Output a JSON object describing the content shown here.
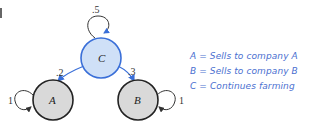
{
  "diagram": {
    "type": "state-transition",
    "nodes": [
      {
        "id": "C",
        "label": "C",
        "fill": "#cfe0f7",
        "stroke": "#3a6fd8"
      },
      {
        "id": "A",
        "label": "A",
        "fill": "#d9d9d9",
        "stroke": "#222222"
      },
      {
        "id": "B",
        "label": "B",
        "fill": "#d9d9d9",
        "stroke": "#222222"
      }
    ],
    "edges": [
      {
        "from": "C",
        "to": "C",
        "label": ".5"
      },
      {
        "from": "C",
        "to": "A",
        "label": ".2"
      },
      {
        "from": "C",
        "to": "B",
        "label": ".3"
      },
      {
        "from": "A",
        "to": "A",
        "label": "1"
      },
      {
        "from": "B",
        "to": "B",
        "label": "1"
      }
    ],
    "legend": [
      "A = Sells to company A",
      "B = Sells to company B",
      "C = Continues farming"
    ],
    "colors": {
      "edge_blue": "#3a6fd8",
      "edge_dark": "#222222",
      "legend_text": "#4a6fd0"
    }
  }
}
